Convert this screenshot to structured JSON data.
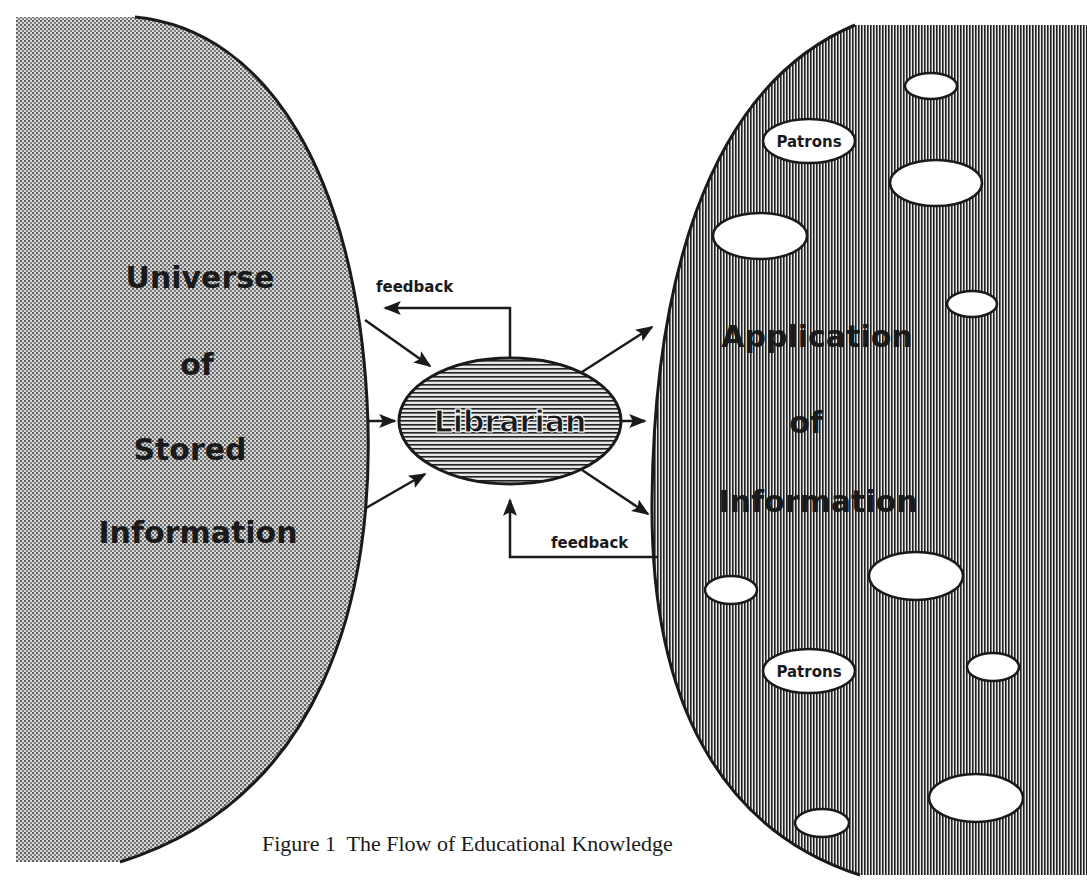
{
  "diagram": {
    "left_region": {
      "lines": [
        "Universe",
        "of",
        "Stored",
        "Information"
      ]
    },
    "center_node": {
      "label": "Librarian"
    },
    "right_region": {
      "lines": [
        "Application",
        "of",
        "Information"
      ],
      "patron_label_1": "Patrons",
      "patron_label_2": "Patrons"
    },
    "feedback_top": "feedback",
    "feedback_bottom": "feedback",
    "caption": "Figure 1  The Flow of Educational Knowledge"
  },
  "colors": {
    "ink": "#1a1a1a",
    "background": "#ffffff",
    "stipple_base": "#bdbdbd",
    "stripe_base": "#8c8c8c"
  }
}
